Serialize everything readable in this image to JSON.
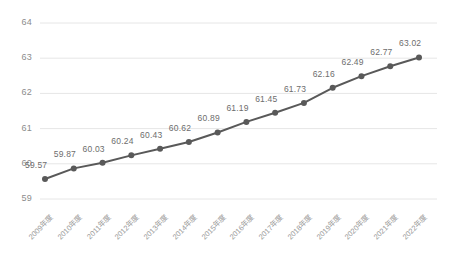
{
  "chart_data": {
    "type": "line",
    "title": "",
    "subtitle": "",
    "xlabel": "",
    "ylabel": "",
    "ylim": [
      58,
      64
    ],
    "yticks": [
      58,
      59,
      60,
      61,
      62,
      63,
      64
    ],
    "ytick_labels": [
      "58",
      "59",
      "60",
      "61",
      "62",
      "63",
      "64"
    ],
    "grid": true,
    "legend": "none",
    "categories": [
      "2009年度",
      "2010年度",
      "2011年度",
      "2012年度",
      "2013年度",
      "2014年度",
      "2015年度",
      "2016年度",
      "2017年度",
      "2018年度",
      "2019年度",
      "2020年度",
      "2021年度",
      "2022年度"
    ],
    "values": [
      59.57,
      59.87,
      60.03,
      60.24,
      60.43,
      60.62,
      60.89,
      61.19,
      61.45,
      61.73,
      62.16,
      62.49,
      62.77,
      63.02
    ],
    "data_labels": [
      "59.57",
      "59.87",
      "60.03",
      "60.24",
      "60.43",
      "60.62",
      "60.89",
      "61.19",
      "61.45",
      "61.73",
      "62.16",
      "62.49",
      "62.77",
      "63.02"
    ],
    "series_color": "#595959",
    "grid_color": "#e6e6e6",
    "marker": "circle",
    "marker_size": 3
  }
}
